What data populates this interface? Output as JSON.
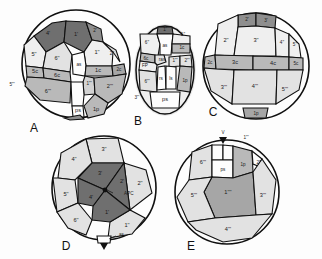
{
  "figure": {
    "background": "#fdfdfd",
    "panel_letters": [
      "A",
      "B",
      "C",
      "D",
      "E"
    ],
    "palette": {
      "white": "#fdfdfd",
      "very_light": "#efefef",
      "light": "#e2e2e2",
      "light_mid": "#d2d2d2",
      "mid": "#b9b9b9",
      "mid_dark": "#a6a6a6",
      "dark": "#8e8e8e",
      "very_dark": "#6f6f6f",
      "outline": "#101010",
      "halo": "#e9e9e9"
    }
  },
  "panels": {
    "A": {
      "letter": "A",
      "caption": "A",
      "shape": "circle",
      "plates": [
        {
          "id": "a-4p",
          "label": "4'",
          "tone": "very_dark"
        },
        {
          "id": "a-1p",
          "label": "1'",
          "tone": "very_dark"
        },
        {
          "id": "a-2p",
          "label": "2'",
          "tone": "dark"
        },
        {
          "id": "a-5pp",
          "label": "5''",
          "tone": "very_light"
        },
        {
          "id": "a-6pp",
          "label": "6''",
          "tone": "light"
        },
        {
          "id": "a-1pp",
          "label": "1''",
          "tone": "very_light"
        },
        {
          "id": "a-2pp",
          "label": "2''",
          "tone": "light"
        },
        {
          "id": "a-as",
          "label": "as",
          "tone": "white"
        },
        {
          "id": "a-1c",
          "label": "1c",
          "tone": "mid"
        },
        {
          "id": "a-2c",
          "label": "2c",
          "tone": "mid_dark"
        },
        {
          "id": "a-5c",
          "label": "5c",
          "tone": "mid"
        },
        {
          "id": "a-6c",
          "label": "6c",
          "tone": "mid"
        },
        {
          "id": "a-5ppp",
          "label": "5'''",
          "tone": "none"
        },
        {
          "id": "a-6ppp",
          "label": "6'''",
          "tone": "mid"
        },
        {
          "id": "a-1ppp",
          "label": "1'''",
          "tone": "light_mid"
        },
        {
          "id": "a-2ppp",
          "label": "2'''",
          "tone": "mid"
        },
        {
          "id": "a-3ppp",
          "label": "3'''",
          "tone": "none"
        },
        {
          "id": "a-ps",
          "label": "ps",
          "tone": "white"
        },
        {
          "id": "a-1p4",
          "label": "1p",
          "tone": "mid"
        }
      ]
    },
    "B": {
      "letter": "B",
      "caption": "B",
      "shape": "oval",
      "plates": [
        {
          "id": "b-1p",
          "label": "1'",
          "tone": "very_dark"
        },
        {
          "id": "b-6pp",
          "label": "6''",
          "tone": "very_light"
        },
        {
          "id": "b-1pp",
          "label": "1''",
          "tone": "very_light"
        },
        {
          "id": "b-as",
          "label": "as",
          "tone": "white"
        },
        {
          "id": "b-1c",
          "label": "1c",
          "tone": "mid"
        },
        {
          "id": "b-6c",
          "label": "6c",
          "tone": "mid"
        },
        {
          "id": "b-ras",
          "label": "ras",
          "tone": "light"
        },
        {
          "id": "b-FP",
          "label": "FP",
          "tone": "none"
        },
        {
          "id": "b-1ppp",
          "label": "1'''",
          "tone": "light"
        },
        {
          "id": "b-2ppp",
          "label": "2'''",
          "tone": "light"
        },
        {
          "id": "b-6ppp",
          "label": "6'''",
          "tone": "light"
        },
        {
          "id": "b-rs",
          "label": "rs",
          "tone": "white"
        },
        {
          "id": "b-ls",
          "label": "ls",
          "tone": "white"
        },
        {
          "id": "b-1p4",
          "label": "1p",
          "tone": "mid"
        },
        {
          "id": "b-ps",
          "label": "ps",
          "tone": "white"
        }
      ]
    },
    "C": {
      "letter": "C",
      "caption": "C",
      "shape": "circle",
      "plates": [
        {
          "id": "c-2p",
          "label": "2'",
          "tone": "very_dark"
        },
        {
          "id": "c-3p",
          "label": "3'",
          "tone": "very_dark"
        },
        {
          "id": "c-2pp",
          "label": "2''",
          "tone": "very_light"
        },
        {
          "id": "c-3pp",
          "label": "3''",
          "tone": "very_light"
        },
        {
          "id": "c-4pp",
          "label": "4''",
          "tone": "very_light"
        },
        {
          "id": "c-5pp",
          "label": "5''",
          "tone": "very_light"
        },
        {
          "id": "c-2c",
          "label": "2c",
          "tone": "mid"
        },
        {
          "id": "c-3c",
          "label": "3c",
          "tone": "mid"
        },
        {
          "id": "c-4c",
          "label": "4c",
          "tone": "mid"
        },
        {
          "id": "c-5c",
          "label": "5c",
          "tone": "mid"
        },
        {
          "id": "c-3ppp",
          "label": "3'''",
          "tone": "light"
        },
        {
          "id": "c-4ppp",
          "label": "4'''",
          "tone": "light"
        },
        {
          "id": "c-5ppp",
          "label": "5'''",
          "tone": "light"
        },
        {
          "id": "c-1p4",
          "label": "1p",
          "tone": "mid_dark"
        }
      ]
    },
    "D": {
      "letter": "D",
      "caption": "D",
      "shape": "circle",
      "apex_label": "as",
      "apc_label": "APC",
      "plates": [
        {
          "id": "d-3p",
          "label": "3'",
          "tone": "very_dark"
        },
        {
          "id": "d-2p",
          "label": "2'",
          "tone": "very_dark"
        },
        {
          "id": "d-1p",
          "label": "1'",
          "tone": "very_dark"
        },
        {
          "id": "d-4p",
          "label": "4'",
          "tone": "very_dark"
        },
        {
          "id": "d-3pp",
          "label": "3''",
          "tone": "light"
        },
        {
          "id": "d-4pp",
          "label": "4''",
          "tone": "light"
        },
        {
          "id": "d-5pp",
          "label": "5''",
          "tone": "light"
        },
        {
          "id": "d-6pp",
          "label": "6''",
          "tone": "light"
        },
        {
          "id": "d-1pp",
          "label": "1''",
          "tone": "light"
        },
        {
          "id": "d-2pp",
          "label": "2''",
          "tone": "light"
        }
      ]
    },
    "E": {
      "letter": "E",
      "caption": "E",
      "shape": "circle",
      "apex_label": "V",
      "plates": [
        {
          "id": "e-6ppp",
          "label": "6'''",
          "tone": "light"
        },
        {
          "id": "e-ps",
          "label": "ps",
          "tone": "white"
        },
        {
          "id": "e-1p4",
          "label": "1p",
          "tone": "mid"
        },
        {
          "id": "e-1pppp",
          "label": "1''''",
          "tone": "mid"
        },
        {
          "id": "e-1ppp",
          "label": "1'''",
          "tone": "none"
        },
        {
          "id": "e-2ppp",
          "label": "2'''",
          "tone": "none"
        },
        {
          "id": "e-5ppp",
          "label": "5'''",
          "tone": "light"
        },
        {
          "id": "e-3ppp",
          "label": "3'''",
          "tone": "light"
        },
        {
          "id": "e-4ppp",
          "label": "4'''",
          "tone": "light"
        }
      ]
    }
  }
}
